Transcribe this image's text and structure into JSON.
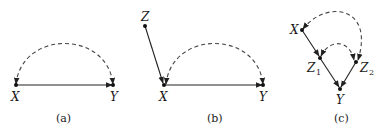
{
  "panels": [
    {
      "caption": "(a)",
      "nodes": [
        {
          "id": "X",
          "label": "X"
        },
        {
          "id": "Y",
          "label": "Y"
        }
      ],
      "edges": [
        {
          "from": "X",
          "to": "Y",
          "type": "directed"
        },
        {
          "from": "X",
          "to": "Y",
          "type": "bidirected-dashed"
        }
      ]
    },
    {
      "caption": "(b)",
      "nodes": [
        {
          "id": "Z",
          "label": "Z"
        },
        {
          "id": "X",
          "label": "X"
        },
        {
          "id": "Y",
          "label": "Y"
        }
      ],
      "edges": [
        {
          "from": "Z",
          "to": "X",
          "type": "directed"
        },
        {
          "from": "X",
          "to": "Y",
          "type": "directed"
        },
        {
          "from": "X",
          "to": "Y",
          "type": "bidirected-dashed"
        }
      ]
    },
    {
      "caption": "(c)",
      "nodes": [
        {
          "id": "X",
          "label": "X"
        },
        {
          "id": "Z1",
          "label": "Z",
          "sub": "1"
        },
        {
          "id": "Z2",
          "label": "Z",
          "sub": "2"
        },
        {
          "id": "Y",
          "label": "Y"
        }
      ],
      "edges": [
        {
          "from": "X",
          "to": "Z1",
          "type": "directed"
        },
        {
          "from": "Z1",
          "to": "Y",
          "type": "directed"
        },
        {
          "from": "Z2",
          "to": "Y",
          "type": "directed"
        },
        {
          "from": "X",
          "to": "Z2",
          "type": "bidirected-dashed"
        },
        {
          "from": "Z1",
          "to": "Z2",
          "type": "bidirected-dashed"
        }
      ]
    }
  ]
}
